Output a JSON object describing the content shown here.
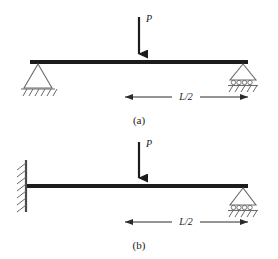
{
  "figure": {
    "width": 278,
    "height": 259,
    "background": "#ffffff",
    "ink_color": "#2b2b2b",
    "beam_color": "#1c1c1c",
    "text_color": "#1a1a1a"
  },
  "panels": [
    {
      "id": "panel-a",
      "caption": "(a)",
      "beam": {
        "x1": 30,
        "x2": 248,
        "y": 62,
        "thickness": 4
      },
      "load": {
        "label": "P",
        "direction": "down",
        "x": 139,
        "y_top": 17,
        "y_tip": 60,
        "label_x": 146,
        "label_y": 22
      },
      "supports": [
        {
          "kind": "pinned",
          "name": "pin-support",
          "x": 38,
          "y": 64
        },
        {
          "kind": "roller",
          "name": "roller-support",
          "x": 243,
          "y": 64
        }
      ],
      "dimension": {
        "label": "L/2",
        "x1": 125,
        "x2": 248,
        "y": 97,
        "label_x": 186,
        "label_y": 96
      },
      "caption_x": 139,
      "caption_y": 124
    },
    {
      "id": "panel-b",
      "caption": "(b)",
      "beam": {
        "x1": 26,
        "x2": 248,
        "y": 186,
        "thickness": 4
      },
      "load": {
        "label": "P",
        "direction": "down",
        "x": 139,
        "y_top": 142,
        "y_tip": 184,
        "label_x": 146,
        "label_y": 147
      },
      "supports": [
        {
          "kind": "fixed-wall",
          "name": "fixed-support",
          "x": 26,
          "y_top": 160,
          "y_bottom": 212
        },
        {
          "kind": "roller",
          "name": "roller-support",
          "x": 243,
          "y": 188
        }
      ],
      "dimension": {
        "label": "L/2",
        "x1": 125,
        "x2": 248,
        "y": 222,
        "label_x": 186,
        "label_y": 221
      },
      "caption_x": 139,
      "caption_y": 249
    }
  ]
}
